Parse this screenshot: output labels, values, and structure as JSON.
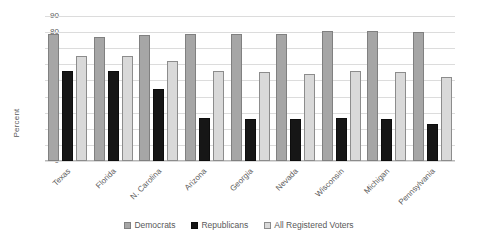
{
  "chart_data": {
    "type": "bar",
    "title": "",
    "xlabel": "",
    "ylabel": "Percent",
    "ylim": [
      0,
      90
    ],
    "ytick_step": 10,
    "yticks": [
      90,
      80,
      70,
      60,
      50,
      40,
      30,
      20,
      10,
      0
    ],
    "grid": true,
    "legend_position": "bottom",
    "categories": [
      "Texas",
      "Florida",
      "N. Carolina",
      "Arizona",
      "Georgia",
      "Nevada",
      "Wisconsin",
      "Michigan",
      "Pennsylvania"
    ],
    "series": [
      {
        "name": "Democrats",
        "color": "#a6a6a6",
        "values": [
          79,
          77,
          78,
          79,
          79,
          79,
          81,
          81,
          80
        ]
      },
      {
        "name": "Republicans",
        "color": "#161616",
        "values": [
          56,
          56,
          45,
          27,
          26,
          26,
          27,
          26,
          23
        ]
      },
      {
        "name": "All Registered Voters",
        "color": "#d9d9d9",
        "values": [
          65,
          65,
          62,
          56,
          55,
          54,
          56,
          55,
          52
        ]
      }
    ]
  }
}
